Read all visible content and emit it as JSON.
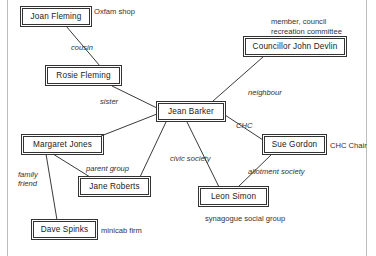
{
  "diagram": {
    "type": "node-link-network",
    "nodes": [
      {
        "id": "joan",
        "label": "Joan Fleming",
        "x": 22,
        "y": 8,
        "w": 68,
        "h": 17
      },
      {
        "id": "rosie",
        "label": "Rosie Fleming",
        "x": 47,
        "y": 67,
        "w": 73,
        "h": 17
      },
      {
        "id": "jean",
        "label": "Jean Barker",
        "x": 158,
        "y": 103,
        "w": 66,
        "h": 17
      },
      {
        "id": "councillor",
        "label": "Councillor John Devlin",
        "x": 245,
        "y": 38,
        "w": 100,
        "h": 17
      },
      {
        "id": "margaret",
        "label": "Margaret Jones",
        "x": 23,
        "y": 136,
        "w": 79,
        "h": 17
      },
      {
        "id": "jane",
        "label": "Jane Roberts",
        "x": 80,
        "y": 178,
        "w": 69,
        "h": 17
      },
      {
        "id": "dave",
        "label": "Dave Spinks",
        "x": 33,
        "y": 221,
        "w": 63,
        "h": 17
      },
      {
        "id": "sue",
        "label": "Sue Gordon",
        "x": 264,
        "y": 136,
        "w": 61,
        "h": 17
      },
      {
        "id": "leon",
        "label": "Leon Simon",
        "x": 200,
        "y": 188,
        "w": 67,
        "h": 17
      }
    ],
    "edges": [
      {
        "id": "joan-rosie",
        "from": "joan",
        "to": "rosie",
        "x1": 66,
        "y1": 26,
        "x2": 100,
        "y2": 66,
        "label": "cousin",
        "lx": 71,
        "ly": 43
      },
      {
        "id": "rosie-jean",
        "from": "rosie",
        "to": "jean",
        "x1": 112,
        "y1": 86,
        "x2": 157,
        "y2": 108,
        "label": "sister",
        "lx": 100,
        "ly": 97
      },
      {
        "id": "councillor-jean",
        "from": "councillor",
        "to": "jean",
        "x1": 263,
        "y1": 57,
        "x2": 213,
        "y2": 101,
        "label": "neighbour",
        "lx": 248,
        "ly": 88
      },
      {
        "id": "jean-margaret",
        "from": "jean",
        "to": "margaret",
        "x1": 157,
        "y1": 114,
        "x2": 101,
        "y2": 136,
        "label": "",
        "lx": 0,
        "ly": 0
      },
      {
        "id": "jean-jane",
        "from": "jean",
        "to": "jane",
        "x1": 166,
        "y1": 122,
        "x2": 140,
        "y2": 177,
        "label": "",
        "lx": 0,
        "ly": 0
      },
      {
        "id": "jean-leon",
        "from": "jean",
        "to": "leon",
        "x1": 187,
        "y1": 122,
        "x2": 219,
        "y2": 187,
        "label": "civic society",
        "lx": 170,
        "ly": 154
      },
      {
        "id": "jean-sue",
        "from": "jean",
        "to": "sue",
        "x1": 225,
        "y1": 115,
        "x2": 263,
        "y2": 140,
        "label": "CHC",
        "lx": 236,
        "ly": 121
      },
      {
        "id": "sue-leon",
        "from": "sue",
        "to": "leon",
        "x1": 272,
        "y1": 154,
        "x2": 238,
        "y2": 187,
        "label": "allotment society",
        "lx": 248,
        "ly": 167
      },
      {
        "id": "margaret-jane",
        "from": "margaret",
        "to": "jane",
        "x1": 53,
        "y1": 154,
        "x2": 90,
        "y2": 177,
        "label": "parent group",
        "lx": 86,
        "ly": 164
      },
      {
        "id": "margaret-dave",
        "from": "margaret",
        "to": "dave",
        "x1": 46,
        "y1": 154,
        "x2": 57,
        "y2": 220,
        "label": "family\nfriend",
        "lx": 18,
        "ly": 170
      }
    ],
    "notes": [
      {
        "id": "oxfam",
        "text": "Oxfam shop",
        "x": 94,
        "y": 7,
        "anchor": "joan"
      },
      {
        "id": "committee",
        "text": "member, council\nrecreation committee",
        "x": 271,
        "y": 17,
        "anchor": "councillor"
      },
      {
        "id": "chc-chair",
        "text": "CHC Chair",
        "x": 330,
        "y": 141,
        "anchor": "sue"
      },
      {
        "id": "synagogue",
        "text": "synagogue social group",
        "x": 205,
        "y": 214,
        "anchor": "leon"
      },
      {
        "id": "minicab",
        "text": "minicab firm",
        "x": 101,
        "y": 226,
        "anchor": "dave"
      }
    ],
    "colors": {
      "node_border": "#333333",
      "edge_stroke": "#3a3a3a",
      "text": "#222222",
      "page_rule": "#bdbdbd",
      "background": "#ffffff"
    }
  }
}
